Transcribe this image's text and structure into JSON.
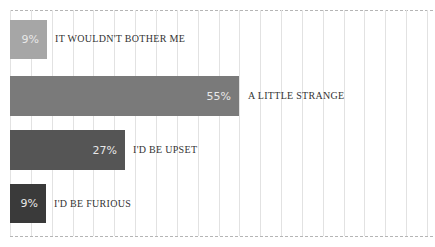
{
  "chart_data": {
    "type": "bar",
    "orientation": "horizontal",
    "title": "",
    "xlabel": "",
    "ylabel": "",
    "categories": [
      "IT WOULDN'T BOTHER ME",
      "A LITTLE STRANGE",
      "I'D BE UPSET",
      "I'D BE FURIOUS"
    ],
    "values": [
      9,
      55,
      27,
      9
    ],
    "value_labels": [
      "9%",
      "55%",
      "27%",
      "9%"
    ],
    "unit": "%",
    "xlim": [
      0,
      100
    ],
    "grid": true,
    "legend": "none",
    "colors": [
      "#a6a6a6",
      "#7a7a7a",
      "#555555",
      "#3a3a3a"
    ]
  },
  "bars": [
    {
      "value": "9%",
      "label": "IT WOULDN'T BOTHER ME",
      "color": "#a6a6a6"
    },
    {
      "value": "55%",
      "label": "A LITTLE STRANGE",
      "color": "#7a7a7a"
    },
    {
      "value": "27%",
      "label": "I'D BE UPSET",
      "color": "#555555"
    },
    {
      "value": "9%",
      "label": "I'D BE FURIOUS",
      "color": "#3a3a3a"
    }
  ]
}
